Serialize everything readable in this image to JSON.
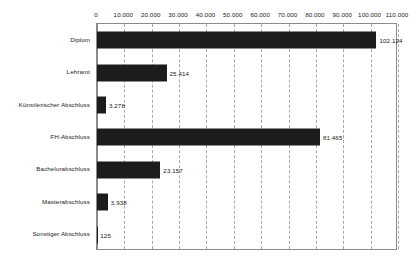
{
  "chart_data": {
    "type": "bar",
    "orientation": "horizontal",
    "title": "",
    "subtitle": "",
    "xlabel": "",
    "ylabel": "",
    "categories": [
      "Diplom",
      "Lehramt",
      "Künstlerischer Abschluss",
      "FH-Abschluss",
      "Bachelorabschluss",
      "Masterabschluss",
      "Sonstiger Abschluss"
    ],
    "values": [
      102124,
      25414,
      3278,
      81465,
      23157,
      3938,
      125
    ],
    "value_labels": [
      "102.124",
      "25.414",
      "3.278",
      "81.465",
      "23.157",
      "3.938",
      "125"
    ],
    "xlim": [
      0,
      110000
    ],
    "xticks": [
      0,
      10000,
      20000,
      30000,
      40000,
      50000,
      60000,
      70000,
      80000,
      90000,
      100000,
      110000
    ],
    "xtick_labels": [
      "0",
      "10.000",
      "20.000",
      "30.000",
      "40.000",
      "50.000",
      "60.000",
      "70.000",
      "80.000",
      "90.000",
      "100.000",
      "110.000"
    ],
    "grid": {
      "vertical": true,
      "horizontal": false,
      "style": "dashed"
    },
    "legend": {
      "visible": false,
      "entries": []
    },
    "colors": {
      "bar": "#1c1c1c",
      "background": "#ffffff",
      "frame": "#8b8b8b",
      "gridline": "#a8a8a8",
      "text": "#1a1a1a"
    }
  }
}
